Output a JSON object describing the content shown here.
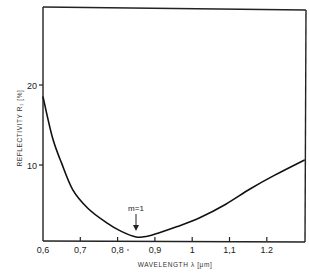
{
  "chart_data": {
    "type": "line",
    "title": "",
    "xlabel": "WAVELENGTH λ [μm]",
    "ylabel": "REFLECTIVITY R₁ [%]",
    "x_tick_labels": [
      "0,6",
      "0,7",
      "0,8",
      "0,9",
      "1",
      "1,1",
      "1.2"
    ],
    "x_ticks": [
      0.6,
      0.7,
      0.8,
      0.9,
      1.0,
      1.1,
      1.2
    ],
    "y_tick_labels": [
      "10",
      "20"
    ],
    "y_ticks": [
      10,
      20
    ],
    "xlim": [
      0.6,
      1.3
    ],
    "ylim": [
      0,
      25
    ],
    "grid": false,
    "legend": null,
    "series": [
      {
        "name": "Reflectivity",
        "x": [
          0.6,
          0.625,
          0.65,
          0.68,
          0.72,
          0.77,
          0.81,
          0.85,
          0.88,
          0.91,
          0.96,
          1.02,
          1.09,
          1.155,
          1.22,
          1.3
        ],
        "y": [
          18.5,
          13.5,
          10.2,
          6.9,
          4.6,
          2.8,
          1.7,
          1.0,
          1.1,
          1.5,
          2.3,
          3.4,
          5.1,
          7.0,
          8.7,
          10.6
        ]
      }
    ],
    "annotations": [
      {
        "text": "m=1",
        "x": 0.855,
        "arrow_to_y": 1.0
      }
    ]
  }
}
